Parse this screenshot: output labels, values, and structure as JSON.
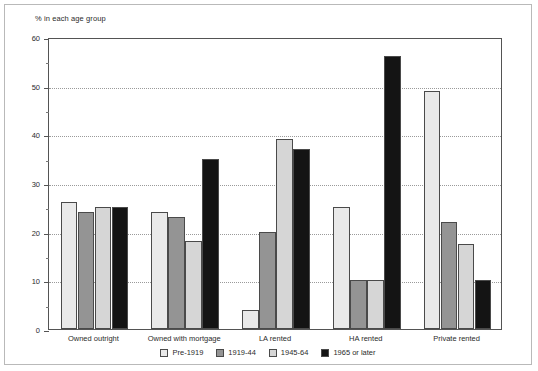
{
  "chart_data": {
    "type": "bar",
    "title": "",
    "ylabel": "% in each age group",
    "xlabel": "",
    "ylim": [
      0,
      60
    ],
    "yticks": [
      0,
      10,
      20,
      30,
      40,
      50,
      60
    ],
    "ytick_labels": [
      "0",
      "10",
      "20",
      "30",
      "40",
      "50",
      "60"
    ],
    "minor_tick_step": 5,
    "grid": "horizontal-dotted",
    "legend_position": "bottom-center",
    "categories": [
      "Owned outright",
      "Owned with mortgage",
      "LA rented",
      "HA rented",
      "Private rented"
    ],
    "series": [
      {
        "name": "Pre-1919",
        "color": "#e9e9e9",
        "values": [
          26,
          24,
          4,
          25,
          49
        ]
      },
      {
        "name": "1919-44",
        "color": "#949494",
        "values": [
          24,
          23,
          20,
          10,
          22
        ]
      },
      {
        "name": "1945-64",
        "color": "#d6d6d6",
        "values": [
          25,
          18,
          39,
          10,
          17.5
        ]
      },
      {
        "name": "1965 or later",
        "color": "#141414",
        "values": [
          25,
          35,
          37,
          56,
          10
        ]
      }
    ]
  },
  "colors": {
    "frame": "#b9b9b9",
    "axis": "#545454",
    "grid": "#9a9a9a",
    "text": "#2b2b2b",
    "bar_border": "#4a4a4a"
  }
}
